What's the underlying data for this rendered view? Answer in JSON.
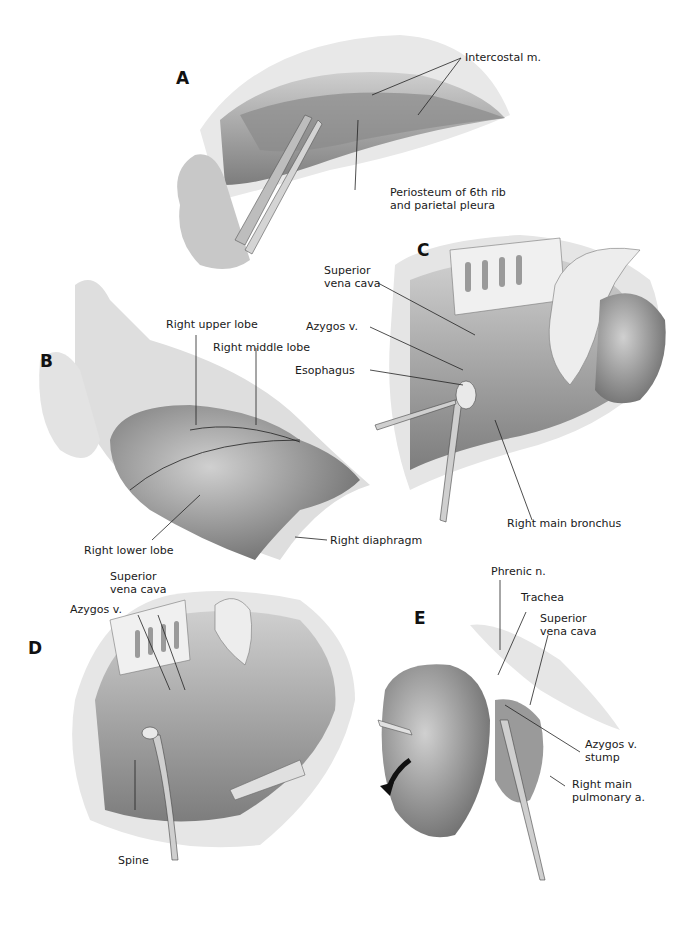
{
  "figure": {
    "panels": [
      {
        "id": "A",
        "letter": "A",
        "labels": [
          "Intercostal m.",
          "Periosteum of 6th rib\nand parietal pleura"
        ]
      },
      {
        "id": "B",
        "letter": "B",
        "labels": [
          "Right upper lobe",
          "Right middle lobe",
          "Right lower lobe",
          "Right diaphragm"
        ]
      },
      {
        "id": "C",
        "letter": "C",
        "labels": [
          "Superior\nvena cava",
          "Azygos v.",
          "Esophagus",
          "Right main bronchus"
        ]
      },
      {
        "id": "D",
        "letter": "D",
        "labels": [
          "Superior\nvena cava",
          "Azygos v.",
          "Spine"
        ]
      },
      {
        "id": "E",
        "letter": "E",
        "labels": [
          "Phrenic n.",
          "Trachea",
          "Superior\nvena cava",
          "Azygos v.\nstump",
          "Right main\npulmonary a."
        ]
      }
    ],
    "colors": {
      "background": "#ffffff",
      "tissue_light": "#d9d9d9",
      "tissue_mid": "#a6a6a6",
      "tissue_dark": "#6e6e6e",
      "ink": "#1a1a1a"
    }
  }
}
